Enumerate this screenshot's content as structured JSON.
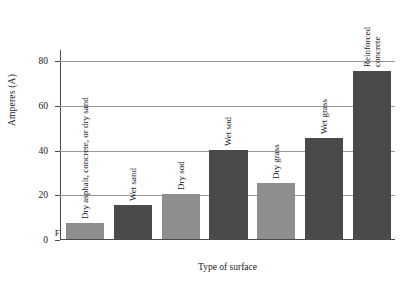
{
  "chart_data": {
    "type": "bar",
    "title": "",
    "xlabel": "Type of surface",
    "ylabel": "Amperes (A)",
    "ylim": [
      0,
      85
    ],
    "yticks": [
      0,
      20,
      40,
      60,
      80
    ],
    "grid": true,
    "legend": "none",
    "categories": [
      "Dry asphalt, concrete, or dry sand",
      "Wet sand",
      "Dry sod",
      "Wet sod",
      "Dry grass",
      "Wet grass",
      "Reinforced concrete"
    ],
    "values": [
      7,
      15,
      20,
      40,
      25,
      45,
      75
    ],
    "bar_colors": [
      "#8e8e8e",
      "#4a4a4a",
      "#8e8e8e",
      "#4a4a4a",
      "#8e8e8e",
      "#4a4a4a",
      "#4a4a4a"
    ],
    "annotations": [
      {
        "text": "F",
        "category": "Dry asphalt, concrete, or dry sand"
      }
    ]
  },
  "axis": {
    "y_title": "Amperes (A)",
    "x_title": "Type of surface",
    "tick_labels": [
      "0",
      "20",
      "40",
      "60",
      "80"
    ]
  },
  "bars": [
    {
      "label": "Dry asphalt, concrete, or dry sand",
      "value": 7,
      "marker": "F"
    },
    {
      "label": "Wet sand",
      "value": 15,
      "marker": ""
    },
    {
      "label": "Dry sod",
      "value": 20,
      "marker": ""
    },
    {
      "label": "Wet sod",
      "value": 40,
      "marker": ""
    },
    {
      "label": "Dry grass",
      "value": 25,
      "marker": ""
    },
    {
      "label": "Wet grass",
      "value": 45,
      "marker": ""
    },
    {
      "label": "Reinforced\nconcrete",
      "value": 75,
      "marker": ""
    }
  ],
  "colors": {
    "bar_light": "#8e8e8e",
    "bar_dark": "#4a4a4a",
    "gridline": "#9a9a9a",
    "axis": "#4a4a4a",
    "background": "#ffffff",
    "text": "#1a1a1a"
  }
}
